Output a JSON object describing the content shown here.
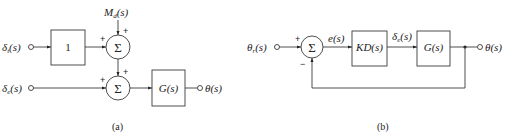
{
  "diagram_a": {
    "caption": "(a)",
    "input_top": {
      "main": "δ",
      "sub": "t",
      "arg": "(s)"
    },
    "input_bottom": {
      "main": "δ",
      "sub": "e",
      "arg": "(s)"
    },
    "disturbance": {
      "main": "M",
      "sub": "d",
      "arg": "(s)"
    },
    "gain_block": "1",
    "plant_block": "G(s)",
    "output": "θ(s)",
    "sum_symbol": "Σ",
    "sum1_signs": {
      "left": "+",
      "top": "+"
    },
    "sum2_signs": {
      "left": "+",
      "top": "+"
    }
  },
  "diagram_b": {
    "caption": "(b)",
    "input": {
      "main": "θ",
      "sub": "r",
      "arg": "(s)"
    },
    "error": "e(s)",
    "controller_block": "KD(s)",
    "control_signal": {
      "main": "δ",
      "sub": "e",
      "arg": "(s)"
    },
    "plant_block": "G(s)",
    "output": "θ(s)",
    "sum_symbol": "Σ",
    "sum_signs": {
      "left": "+",
      "bottom": "−"
    }
  }
}
